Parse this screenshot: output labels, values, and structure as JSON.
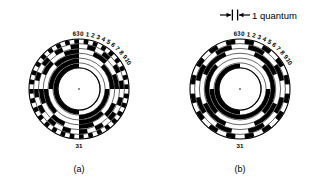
{
  "figure": {
    "background": "#ffffff",
    "ink": "#000000",
    "panels": [
      {
        "id": "a",
        "caption": "(a)",
        "code_type": "binary",
        "tracks": 6,
        "sectors": 64,
        "center": {
          "x": 79,
          "y": 89
        },
        "outer_radius": 50,
        "inner_radius": 21,
        "tick_labels": [
          "63",
          "0",
          "1",
          "2",
          "3",
          "4",
          "5",
          "6",
          "7",
          "8",
          "9",
          "10"
        ],
        "bottom_label": "31"
      },
      {
        "id": "b",
        "caption": "(b)",
        "code_type": "gray",
        "tracks": 6,
        "sectors": 64,
        "center": {
          "x": 240,
          "y": 89
        },
        "outer_radius": 50,
        "inner_radius": 21,
        "tick_labels": [
          "63",
          "0",
          "1",
          "2",
          "3",
          "4",
          "5",
          "6",
          "7",
          "8",
          "9",
          "10"
        ],
        "bottom_label": "31"
      }
    ],
    "annotation": {
      "label": "1 quantum",
      "left_arrow": "→|",
      "right_arrow": "|←"
    }
  },
  "chart_data": {
    "type": "diagram",
    "title": "",
    "subtitle": "",
    "panels": [
      {
        "label": "(a)",
        "code": "natural binary",
        "tracks": 6,
        "sectors": 64,
        "track_order": "LSB outermost, MSB innermost",
        "labelled_sectors": [
          63,
          0,
          1,
          2,
          3,
          4,
          5,
          6,
          7,
          8,
          9,
          10,
          31
        ],
        "note": "Adjacent sectors may differ in several bits simultaneously"
      },
      {
        "label": "(b)",
        "code": "Gray (cyclic unit-distance)",
        "tracks": 6,
        "sectors": 64,
        "track_order": "LSB outermost, MSB innermost",
        "labelled_sectors": [
          63,
          0,
          1,
          2,
          3,
          4,
          5,
          6,
          7,
          8,
          9,
          10,
          31
        ],
        "note": "Adjacent sectors differ in exactly one bit"
      }
    ],
    "annotations": [
      {
        "text": "1 quantum",
        "meaning": "angular width of one of the 64 sectors"
      }
    ]
  }
}
